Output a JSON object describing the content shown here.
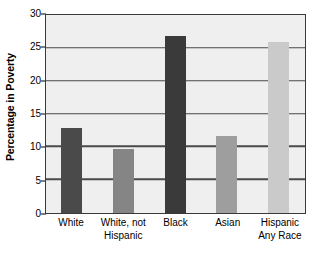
{
  "chart_data": {
    "type": "bar",
    "title": "",
    "xlabel": "",
    "ylabel": "Percentage in Poverty",
    "ylim": [
      0,
      30
    ],
    "yticks": [
      0,
      5,
      10,
      15,
      20,
      25,
      30
    ],
    "ytick_labels": [
      "0",
      "5",
      "10",
      "15",
      "20",
      "25",
      "30"
    ],
    "grid": true,
    "legend": "none",
    "categories": [
      "White",
      "White, not Hispanic",
      "Black",
      "Asian",
      "Hispanic Any Race"
    ],
    "category_lines": [
      [
        "White"
      ],
      [
        "White, not",
        "Hispanic"
      ],
      [
        "Black"
      ],
      [
        "Asian"
      ],
      [
        "Hispanic",
        "Any Race"
      ]
    ],
    "values": [
      13.0,
      9.7,
      27.0,
      11.8,
      26.0
    ],
    "bar_colors": [
      "#4a4a4a",
      "#858585",
      "#3a3a3a",
      "#9e9e9e",
      "#cacaca"
    ],
    "plot_background": "#efefef",
    "axis_color": "#3a3a3a",
    "gridline_color": "#4a4a4a"
  }
}
